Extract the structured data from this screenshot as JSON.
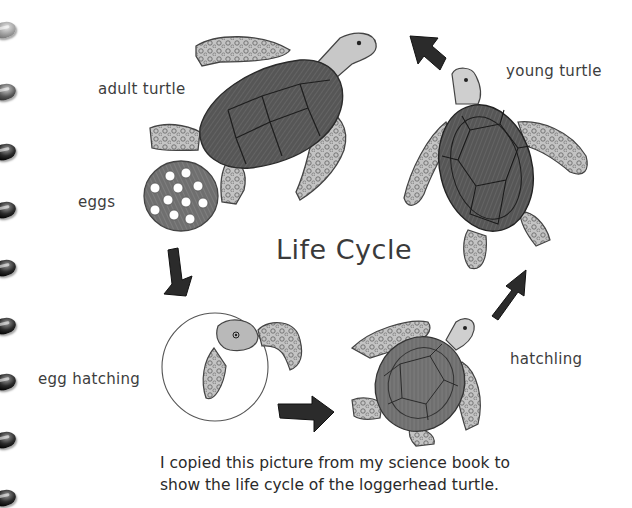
{
  "page": {
    "title": "Life Cycle",
    "caption_lines": [
      "I copied this picture from my science book to",
      "show the life cycle of the loggerhead turtle."
    ]
  },
  "stages": [
    {
      "id": "adult",
      "label": "adult turtle",
      "icon": "adult-turtle-drawing"
    },
    {
      "id": "eggs",
      "label": "eggs",
      "icon": "egg-cluster-drawing"
    },
    {
      "id": "egg_hatching",
      "label": "egg hatching",
      "icon": "hatching-egg-drawing"
    },
    {
      "id": "hatchling",
      "label": "hatchling",
      "icon": "hatchling-turtle-drawing"
    },
    {
      "id": "young",
      "label": "young turtle",
      "icon": "young-turtle-drawing"
    }
  ],
  "arrows": [
    {
      "from": "eggs",
      "to": "egg_hatching",
      "direction": "down"
    },
    {
      "from": "egg_hatching",
      "to": "hatchling",
      "direction": "right"
    },
    {
      "from": "hatchling",
      "to": "young",
      "direction": "up-right"
    },
    {
      "from": "young",
      "to": "adult",
      "direction": "up-left"
    }
  ],
  "notebook": {
    "spiral_rings": 9
  },
  "colors": {
    "background": "#ffffff",
    "text": "#3a3a3a",
    "shell": "#4a4a4a",
    "flipper": "#bdbdbd",
    "arrow": "#2b2b2b"
  }
}
